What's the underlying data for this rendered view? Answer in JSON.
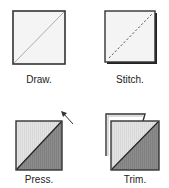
{
  "steps": [
    {
      "label": "Draw.",
      "description": "Square with diagonal pencil line"
    },
    {
      "label": "Stitch.",
      "description": "Square with dashed diagonal stitch line"
    },
    {
      "label": "Press.",
      "description": "Half-square triangle pressed, arrow showing direction"
    },
    {
      "label": "Trim.",
      "description": "Half-square triangle trimmed from larger square"
    }
  ],
  "colors": {
    "outline": "#2a2a2a",
    "light_fabric": "#e6e6e6",
    "dark_fabric": "#8a8a8a",
    "background_square": "#f4f4f4"
  }
}
